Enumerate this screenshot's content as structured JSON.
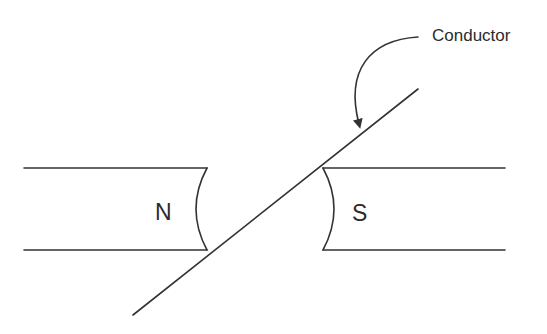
{
  "diagram": {
    "type": "magnetic field with conductor",
    "labels": {
      "conductor": "Conductor",
      "north_pole": "N",
      "south_pole": "S"
    },
    "colors": {
      "line": "#333333",
      "text": "#2b2b2b",
      "background": "#ffffff"
    }
  }
}
